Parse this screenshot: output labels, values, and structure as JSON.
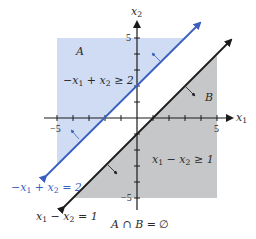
{
  "figure": {
    "axes": {
      "x_label": "x",
      "x_label_sub": "1",
      "y_label": "x",
      "y_label_sub": "2",
      "x_ticks": [
        -5,
        -4,
        -3,
        -2,
        -1,
        1,
        2,
        3,
        4,
        5
      ],
      "y_ticks": [
        -5,
        -4,
        -3,
        -2,
        -1,
        1,
        2,
        3,
        4,
        5
      ],
      "x_tick_labels": {
        "neg": "−5",
        "pos": "5"
      },
      "y_tick_labels": {
        "neg": "−5",
        "pos": "5"
      },
      "range": [
        -5,
        5
      ]
    },
    "region_a": {
      "name": "A",
      "inequality": "−x₁ + x₂ ≥ 2",
      "color": "#cfdcf3"
    },
    "region_b": {
      "name": "B",
      "inequality": "x₁ − x₂ ≥ 1",
      "color": "#c6c7c9"
    },
    "line_a": {
      "equation": "−x₁ + x₂ = 2",
      "color": "#3a5fc0"
    },
    "line_b": {
      "equation": "x₁ − x₂ = 1",
      "color": "#1a1a1a"
    },
    "caption": "A ∩ B = ∅"
  },
  "labels": {
    "region_a_name": "A",
    "region_b_name": "B",
    "ineq_a_parts": [
      "−x",
      "1",
      " + x",
      "2",
      " ≥ 2"
    ],
    "ineq_b_parts": [
      "x",
      "1",
      " − x",
      "2",
      " ≥ 1"
    ],
    "line_a_parts": [
      "−x",
      "1",
      " + x",
      "2",
      " = 2"
    ],
    "line_b_parts": [
      "x",
      "1",
      " − x",
      "2",
      " = 1"
    ],
    "caption_parts": [
      "A ∩ B = ",
      "∅"
    ]
  }
}
